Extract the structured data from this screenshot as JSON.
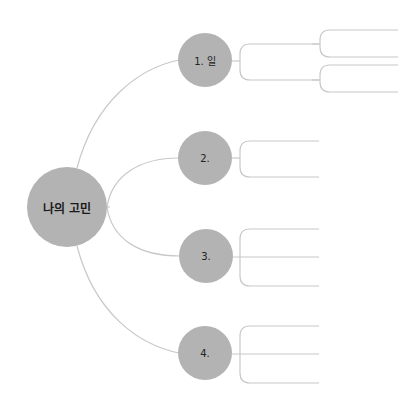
{
  "diagram": {
    "type": "mind-map",
    "root": {
      "label": "나의 고민",
      "color": "#b3b3b3"
    },
    "branches": [
      {
        "label": "1. 일",
        "children": [
          {
            "label": "",
            "children": [
              {
                "label": ""
              },
              {
                "label": ""
              }
            ]
          },
          {
            "label": "",
            "children": [
              {
                "label": ""
              },
              {
                "label": ""
              }
            ]
          }
        ]
      },
      {
        "label": "2.",
        "children": [
          {
            "label": ""
          },
          {
            "label": ""
          }
        ]
      },
      {
        "label": "3.",
        "children": [
          {
            "label": ""
          },
          {
            "label": ""
          },
          {
            "label": ""
          }
        ]
      },
      {
        "label": "4.",
        "children": [
          {
            "label": ""
          },
          {
            "label": ""
          },
          {
            "label": ""
          }
        ]
      }
    ],
    "line_color": "#c8c8c8"
  }
}
